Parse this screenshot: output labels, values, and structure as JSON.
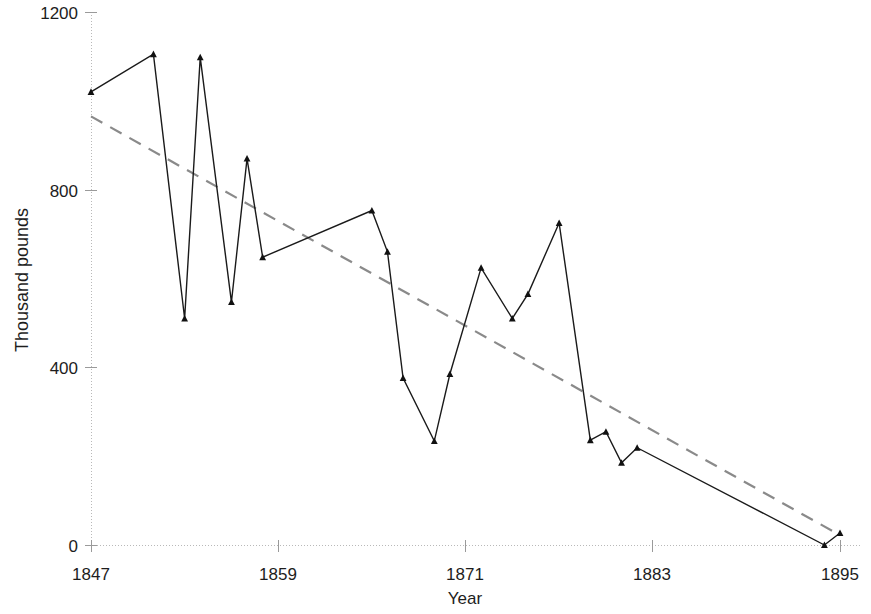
{
  "chart_data": {
    "type": "line",
    "title": "",
    "xlabel": "Year",
    "ylabel": "Thousand pounds",
    "xlim": [
      1847,
      1895
    ],
    "ylim": [
      0,
      1200
    ],
    "xticks": [
      1847,
      1859,
      1871,
      1883,
      1895
    ],
    "xtick_labels": [
      "1847",
      "1859",
      "1871",
      "1883",
      "1895"
    ],
    "yticks": [
      0,
      400,
      800,
      1200
    ],
    "ytick_labels": [
      "0",
      "400",
      "800",
      "1200"
    ],
    "grid": false,
    "legend": null,
    "series": [
      {
        "name": "Observed",
        "style": "solid-with-triangle-markers",
        "color": "#1a1a1a",
        "x": [
          1847,
          1851,
          1853,
          1854,
          1856,
          1857,
          1858,
          1865,
          1866,
          1867,
          1869,
          1870,
          1872,
          1874,
          1875,
          1877,
          1879,
          1880,
          1881,
          1882,
          1894,
          1895
        ],
        "values": [
          1020,
          1105,
          510,
          1098,
          547,
          870,
          648,
          753,
          660,
          376,
          234,
          385,
          624,
          510,
          565,
          725,
          236,
          255,
          185,
          219,
          0,
          27
        ]
      },
      {
        "name": "Linear trend",
        "style": "dashed",
        "color": "#8a8a8a",
        "x": [
          1847,
          1895
        ],
        "values": [
          965,
          22
        ]
      }
    ]
  },
  "axes": {
    "x_title": "Year",
    "y_title": "Thousand pounds"
  }
}
